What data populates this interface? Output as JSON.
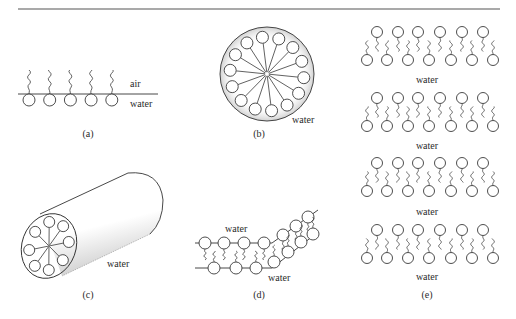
{
  "figure": {
    "panels": {
      "a": {
        "caption": "(a)",
        "label_upper": "air",
        "label_lower": "water",
        "monolayer_molecule_count": 5
      },
      "b": {
        "caption": "(b)",
        "label": "water",
        "micelle_molecule_count": 14
      },
      "c": {
        "caption": "(c)",
        "label": "water",
        "cylinder_end_molecule_count": 8
      },
      "d": {
        "caption": "(d)",
        "label_upper": "water",
        "label_lower": "water"
      },
      "e": {
        "caption": "(e)",
        "layer_labels": [
          "water",
          "water",
          "water",
          "water"
        ],
        "bilayer_count": 4,
        "top_heads_per_bilayer": 6,
        "bottom_heads_per_bilayer": 7
      }
    },
    "colors": {
      "ink": "#333333",
      "background": "#ffffff"
    }
  }
}
